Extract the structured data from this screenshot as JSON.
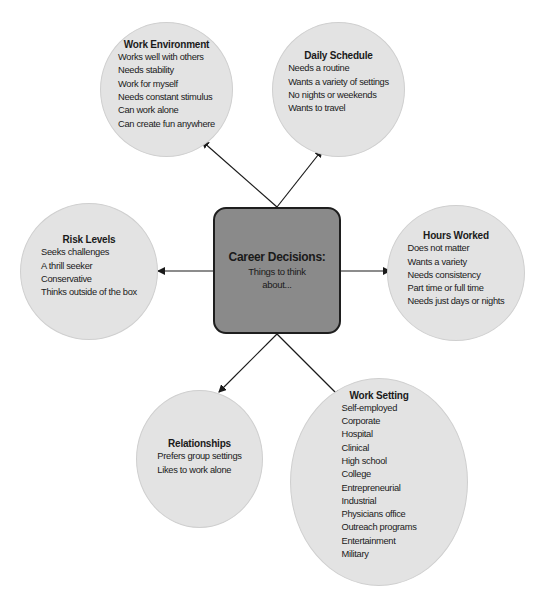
{
  "diagram": {
    "center": {
      "title": "Career Decisions:",
      "subtitle_line1": "Things to think",
      "subtitle_line2": "about..."
    },
    "nodes": [
      {
        "id": "work-environment",
        "title": "Work Environment",
        "items": [
          "Works well with others",
          "Needs stability",
          "Work for myself",
          "Needs constant stimulus",
          "Can work alone",
          "Can create fun anywhere"
        ]
      },
      {
        "id": "daily-schedule",
        "title": "Daily Schedule",
        "items": [
          "Needs a routine",
          "Wants a variety of settings",
          "No nights or weekends",
          "Wants to travel"
        ]
      },
      {
        "id": "risk-levels",
        "title": "Risk Levels",
        "items": [
          "Seeks challenges",
          "A thrill seeker",
          "Conservative",
          "Thinks outside of the box"
        ]
      },
      {
        "id": "hours-worked",
        "title": "Hours Worked",
        "items": [
          "Does not matter",
          "Wants a variety",
          "Needs consistency",
          "Part time or full time",
          "Needs just days or nights"
        ]
      },
      {
        "id": "relationships",
        "title": "Relationships",
        "items": [
          "Prefers group settings",
          "Likes to work alone"
        ]
      },
      {
        "id": "work-setting",
        "title": "Work Setting",
        "items": [
          "Self-employed",
          "Corporate",
          "Hospital",
          "Clinical",
          "High school",
          "College",
          "Entrepreneurial",
          "Industrial",
          "Physicians office",
          "Outreach programs",
          "Entertainment",
          "Military"
        ]
      }
    ],
    "colors": {
      "bubble_fill": "#e3e3e3",
      "bubble_border": "#cfcfcf",
      "center_fill": "#8a8a8a",
      "center_border": "#1e1e1e",
      "arrow": "#1a1a1a"
    }
  }
}
